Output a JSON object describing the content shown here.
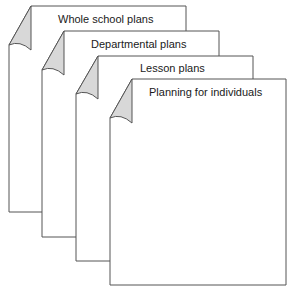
{
  "diagram": {
    "pages": [
      {
        "label": "Whole school plans"
      },
      {
        "label": "Departmental plans"
      },
      {
        "label": "Lesson plans"
      },
      {
        "label": "Planning for individuals"
      }
    ],
    "colors": {
      "stroke": "#555555",
      "curl_fill": "#d8d8d8",
      "page_fill": "#ffffff"
    }
  }
}
